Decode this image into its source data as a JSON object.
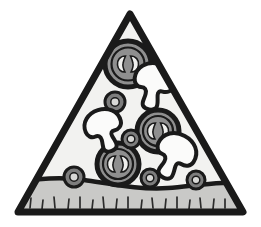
{
  "illustration": {
    "title": "Pizza Slice",
    "subject": "pizza-slice-clipart",
    "style": "black-outline-grayscale-clipart",
    "canvas": {
      "width": 261,
      "height": 227,
      "background": "#ffffff"
    },
    "colors": {
      "outline": "#1a1a1a",
      "cheese_fill": "#f2f2f0",
      "crust_fill": "#c9c9c7",
      "pepperoni_fill": "#8f8f8f",
      "pepperoni_ring": "#1a1a1a",
      "pepperoni_mark": "#f2f2f0",
      "olive_fill": "#7d7d7d",
      "olive_center": "#d8d8d6",
      "mushroom_fill": "#fbfbfa",
      "tick_mark": "#2b2b2b"
    },
    "shapes": {
      "slice_triangle": {
        "name": "pizza-slice-body",
        "apex": [
          130,
          12
        ],
        "bottom_left": [
          16,
          213
        ],
        "bottom_right": [
          245,
          213
        ],
        "stroke_width": 7
      },
      "crust": {
        "name": "pizza-crust",
        "top_wave_y": 184,
        "bottom_y": 213,
        "wave_amplitude": 8,
        "tick_count": 17
      }
    },
    "toppings": {
      "pepperoni_large": [
        {
          "id": "pepperoni-1",
          "cx": 128,
          "cy": 64,
          "r": 23
        },
        {
          "id": "pepperoni-2",
          "cx": 158,
          "cy": 131,
          "r": 21
        },
        {
          "id": "pepperoni-3",
          "cx": 118,
          "cy": 164,
          "r": 21
        }
      ],
      "mushrooms": [
        {
          "id": "mushroom-1",
          "cx": 153,
          "cy": 88,
          "scale": 1.0,
          "rotate": 12
        },
        {
          "id": "mushroom-2",
          "cx": 105,
          "cy": 132,
          "scale": 0.92,
          "rotate": -18
        },
        {
          "id": "mushroom-3",
          "cx": 173,
          "cy": 158,
          "scale": 1.0,
          "rotate": 28
        }
      ],
      "olives": [
        {
          "id": "olive-1",
          "cx": 115,
          "cy": 102,
          "r": 10
        },
        {
          "id": "olive-2",
          "cx": 131,
          "cy": 139,
          "r": 9
        },
        {
          "id": "olive-3",
          "cx": 74,
          "cy": 177,
          "r": 10
        },
        {
          "id": "olive-4",
          "cx": 150,
          "cy": 178,
          "r": 9
        },
        {
          "id": "olive-5",
          "cx": 196,
          "cy": 180,
          "r": 9
        }
      ]
    },
    "counts": {
      "pepperoni": 3,
      "mushrooms": 3,
      "olives": 5
    }
  }
}
